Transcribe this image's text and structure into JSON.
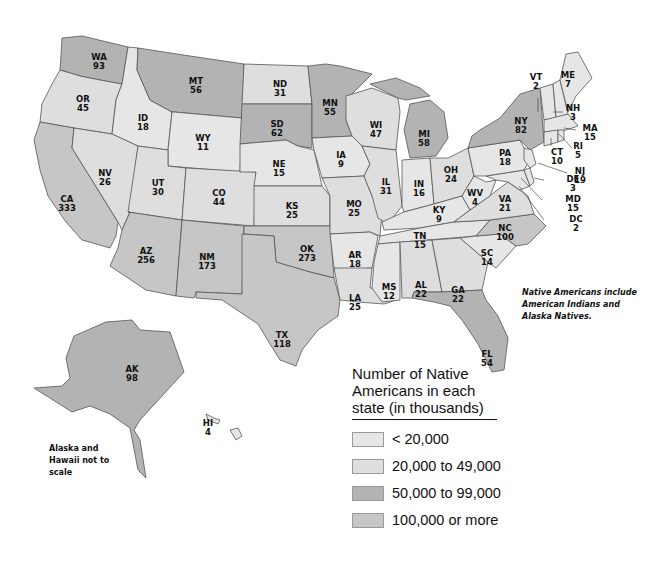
{
  "colors": {
    "under_20k": "#e6e6e6",
    "20k_49k": "#dedede",
    "50k_99k": "#b3b3b3",
    "100k_plus": "#c6c6c6",
    "border": "#555555"
  },
  "legend": {
    "title": "Number of Native Americans in each state (in thousands)",
    "items": [
      {
        "label": "< 20,000",
        "color": "#e6e6e6"
      },
      {
        "label": "20,000 to 49,000",
        "color": "#dedede"
      },
      {
        "label": "50,000 to 99,000",
        "color": "#b3b3b3"
      },
      {
        "label": "100,000 or more",
        "color": "#c6c6c6"
      }
    ]
  },
  "notes": {
    "natives": "Native Americans include American Indians and Alaska Natives.",
    "scale": "Alaska and Hawaii not to scale"
  },
  "states": [
    {
      "abbr": "WA",
      "value": 93
    },
    {
      "abbr": "OR",
      "value": 45
    },
    {
      "abbr": "CA",
      "value": 333
    },
    {
      "abbr": "ID",
      "value": 18
    },
    {
      "abbr": "NV",
      "value": 26
    },
    {
      "abbr": "MT",
      "value": 56
    },
    {
      "abbr": "WY",
      "value": 11
    },
    {
      "abbr": "UT",
      "value": 30
    },
    {
      "abbr": "AZ",
      "value": 256
    },
    {
      "abbr": "CO",
      "value": 44
    },
    {
      "abbr": "NM",
      "value": 173
    },
    {
      "abbr": "ND",
      "value": 31
    },
    {
      "abbr": "SD",
      "value": 62
    },
    {
      "abbr": "NE",
      "value": 15
    },
    {
      "abbr": "KS",
      "value": 25
    },
    {
      "abbr": "OK",
      "value": 273
    },
    {
      "abbr": "TX",
      "value": 118
    },
    {
      "abbr": "MN",
      "value": 55
    },
    {
      "abbr": "IA",
      "value": 9
    },
    {
      "abbr": "MO",
      "value": 25
    },
    {
      "abbr": "AR",
      "value": 18
    },
    {
      "abbr": "LA",
      "value": 25
    },
    {
      "abbr": "WI",
      "value": 47
    },
    {
      "abbr": "IL",
      "value": 31
    },
    {
      "abbr": "MI",
      "value": 58
    },
    {
      "abbr": "IN",
      "value": 16
    },
    {
      "abbr": "OH",
      "value": 24
    },
    {
      "abbr": "KY",
      "value": 9
    },
    {
      "abbr": "TN",
      "value": 15
    },
    {
      "abbr": "MS",
      "value": 12
    },
    {
      "abbr": "AL",
      "value": 22
    },
    {
      "abbr": "GA",
      "value": 22
    },
    {
      "abbr": "FL",
      "value": 54
    },
    {
      "abbr": "SC",
      "value": 14
    },
    {
      "abbr": "NC",
      "value": 100
    },
    {
      "abbr": "VA",
      "value": 21
    },
    {
      "abbr": "WV",
      "value": 4
    },
    {
      "abbr": "PA",
      "value": 18
    },
    {
      "abbr": "NY",
      "value": 82
    },
    {
      "abbr": "VT",
      "value": 2
    },
    {
      "abbr": "NH",
      "value": 3
    },
    {
      "abbr": "ME",
      "value": 7
    },
    {
      "abbr": "MA",
      "value": 15
    },
    {
      "abbr": "RI",
      "value": 5
    },
    {
      "abbr": "CT",
      "value": 10
    },
    {
      "abbr": "NJ",
      "value": 19
    },
    {
      "abbr": "DE",
      "value": 3
    },
    {
      "abbr": "MD",
      "value": 15
    },
    {
      "abbr": "DC",
      "value": 2
    },
    {
      "abbr": "AK",
      "value": 98
    },
    {
      "abbr": "HI",
      "value": 4
    }
  ],
  "chart_data": {
    "type": "choropleth",
    "title": "Number of Native Americans in each state (in thousands)",
    "units": "thousands",
    "bins": [
      "< 20,000",
      "20,000 to 49,000",
      "50,000 to 99,000",
      "100,000 or more"
    ],
    "values": {
      "WA": 93,
      "OR": 45,
      "CA": 333,
      "ID": 18,
      "NV": 26,
      "MT": 56,
      "WY": 11,
      "UT": 30,
      "AZ": 256,
      "CO": 44,
      "NM": 173,
      "ND": 31,
      "SD": 62,
      "NE": 15,
      "KS": 25,
      "OK": 273,
      "TX": 118,
      "MN": 55,
      "IA": 9,
      "MO": 25,
      "AR": 18,
      "LA": 25,
      "WI": 47,
      "IL": 31,
      "MI": 58,
      "IN": 16,
      "OH": 24,
      "KY": 9,
      "TN": 15,
      "MS": 12,
      "AL": 22,
      "GA": 22,
      "FL": 54,
      "SC": 14,
      "NC": 100,
      "VA": 21,
      "WV": 4,
      "PA": 18,
      "NY": 82,
      "VT": 2,
      "NH": 3,
      "ME": 7,
      "MA": 15,
      "RI": 5,
      "CT": 10,
      "NJ": 19,
      "DE": 3,
      "MD": 15,
      "DC": 2,
      "AK": 98,
      "HI": 4
    },
    "annotations": [
      "Native Americans include American Indians and Alaska Natives.",
      "Alaska and Hawaii not to scale"
    ]
  }
}
